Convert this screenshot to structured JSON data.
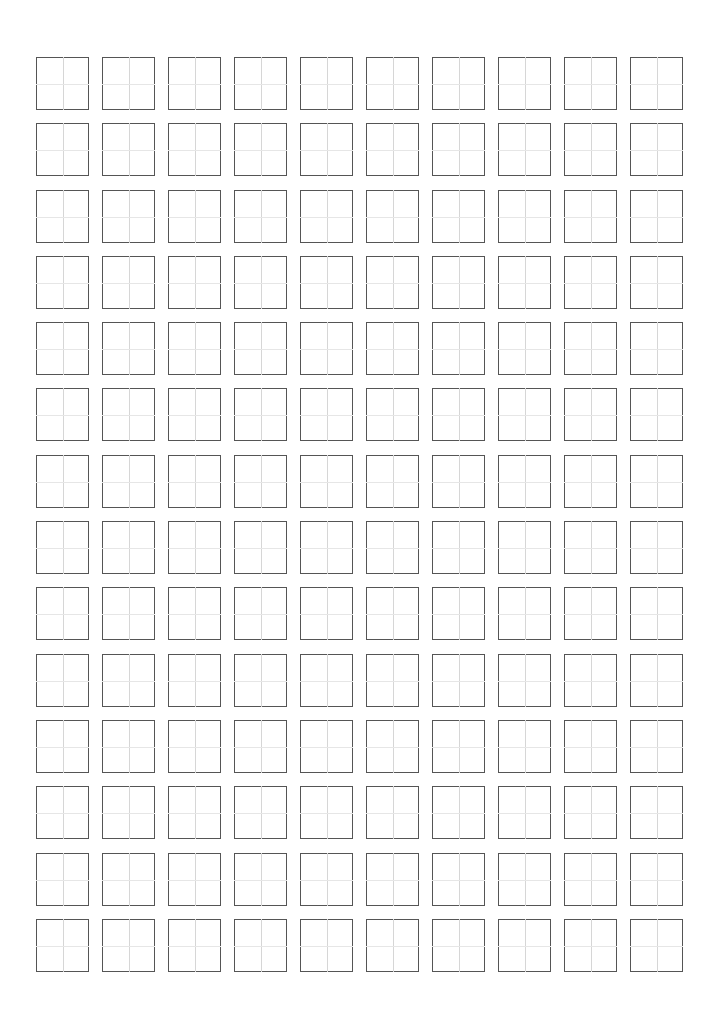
{
  "page": {
    "background_color": "#ffffff",
    "width_px": 701,
    "height_px": 1026
  },
  "grid": {
    "kind": "tianzige-practice-grid",
    "columns": 10,
    "rows": 14,
    "total_cells": 140,
    "origin_x_px": 36,
    "origin_y_px": 57,
    "cell_size_px": 53,
    "column_pitch_px": 66,
    "row_pitch_px": 66.3,
    "column_gap_px": 13,
    "row_gap_px": 13,
    "border_color": "#555555",
    "border_width_px": 1,
    "guide_vertical_color": "#d6d6d6",
    "guide_horizontal_color": "#e6e6e6",
    "guide_width_px": 1,
    "cell_fill_color": "#ffffff",
    "cell_contents": [
      [
        "",
        "",
        "",
        "",
        "",
        "",
        "",
        "",
        "",
        ""
      ],
      [
        "",
        "",
        "",
        "",
        "",
        "",
        "",
        "",
        "",
        ""
      ],
      [
        "",
        "",
        "",
        "",
        "",
        "",
        "",
        "",
        "",
        ""
      ],
      [
        "",
        "",
        "",
        "",
        "",
        "",
        "",
        "",
        "",
        ""
      ],
      [
        "",
        "",
        "",
        "",
        "",
        "",
        "",
        "",
        "",
        ""
      ],
      [
        "",
        "",
        "",
        "",
        "",
        "",
        "",
        "",
        "",
        ""
      ],
      [
        "",
        "",
        "",
        "",
        "",
        "",
        "",
        "",
        "",
        ""
      ],
      [
        "",
        "",
        "",
        "",
        "",
        "",
        "",
        "",
        "",
        ""
      ],
      [
        "",
        "",
        "",
        "",
        "",
        "",
        "",
        "",
        "",
        ""
      ],
      [
        "",
        "",
        "",
        "",
        "",
        "",
        "",
        "",
        "",
        ""
      ],
      [
        "",
        "",
        "",
        "",
        "",
        "",
        "",
        "",
        "",
        ""
      ],
      [
        "",
        "",
        "",
        "",
        "",
        "",
        "",
        "",
        "",
        ""
      ],
      [
        "",
        "",
        "",
        "",
        "",
        "",
        "",
        "",
        "",
        ""
      ],
      [
        "",
        "",
        "",
        "",
        "",
        "",
        "",
        "",
        "",
        ""
      ]
    ]
  },
  "margins": {
    "top_px": 57,
    "left_px": 36,
    "right_px": 26,
    "bottom_px": 51
  }
}
